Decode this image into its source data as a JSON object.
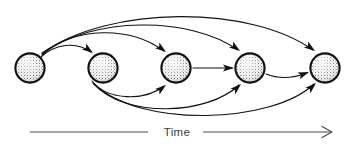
{
  "figure": {
    "type": "diagram",
    "title": "",
    "background_color": "#ffffff",
    "ink_color": "#111111",
    "axis_color": "#4a4a4a",
    "width": 355,
    "height": 147
  },
  "axis": {
    "label": "Time",
    "label_x": 177,
    "label_y": 136,
    "left_segment": {
      "x1": 30,
      "y1": 132,
      "x2": 148,
      "y2": 132
    },
    "right_segment": {
      "x1": 203,
      "y1": 132,
      "x2": 331,
      "y2": 132
    },
    "arrowhead": {
      "x": 331,
      "y": 132,
      "style": "open-v"
    },
    "direction": "left-to-right"
  },
  "nodes": [
    {
      "id": "node-1",
      "label": "",
      "cx": 30,
      "cy": 68,
      "r": 15.2,
      "texture": "stipple"
    },
    {
      "id": "node-2",
      "label": "",
      "cx": 103,
      "cy": 68,
      "r": 15.2,
      "texture": "stipple"
    },
    {
      "id": "node-3",
      "label": "",
      "cx": 176,
      "cy": 68,
      "r": 15.2,
      "texture": "stipple"
    },
    {
      "id": "node-4",
      "label": "",
      "cx": 250,
      "cy": 68,
      "r": 15.2,
      "texture": "stipple"
    },
    {
      "id": "node-5",
      "label": "",
      "cx": 325,
      "cy": 68,
      "r": 15.2,
      "texture": "stipple"
    }
  ],
  "edges": [
    {
      "id": "edge-1-2",
      "from": "node-1",
      "to": "node-2",
      "route": "arc-above",
      "d": "M 41 57 C 55 44, 76 41, 91 52"
    },
    {
      "id": "edge-1-3",
      "from": "node-1",
      "to": "node-3",
      "route": "arc-above",
      "d": "M 42 55 C 75 26, 130 26, 164 51"
    },
    {
      "id": "edge-1-4",
      "from": "node-1",
      "to": "node-4",
      "route": "arc-above",
      "d": "M 42 54 C 92 16, 190 16, 238 50"
    },
    {
      "id": "edge-1-5",
      "from": "node-1",
      "to": "node-5",
      "route": "arc-above",
      "d": "M 42 53 C 110 5, 250 5, 313 50"
    },
    {
      "id": "edge-2-3",
      "from": "node-2",
      "to": "node-3",
      "route": "arc-below",
      "d": "M 92 81 C 108 101, 145 101, 164 86"
    },
    {
      "id": "edge-2-4",
      "from": "node-2",
      "to": "node-4",
      "route": "arc-below",
      "d": "M 93 83 C 125 119, 208 115, 239 85"
    },
    {
      "id": "edge-2-5",
      "from": "node-2",
      "to": "node-5",
      "route": "arc-below",
      "d": "M 94 84 C 140 128, 272 124, 314 84"
    },
    {
      "id": "edge-3-4",
      "from": "node-3",
      "to": "node-4",
      "route": "straight",
      "d": "M 193 68 L 232 68"
    },
    {
      "id": "edge-4-5",
      "from": "node-4",
      "to": "node-5",
      "route": "arc-slight",
      "d": "M 266 74 C 281 80, 294 78, 307 73"
    }
  ],
  "arrowheads": [
    {
      "edge": "edge-1-2",
      "x": 93,
      "y": 53,
      "angle": 36
    },
    {
      "edge": "edge-1-3",
      "x": 166,
      "y": 52,
      "angle": 37
    },
    {
      "edge": "edge-1-4",
      "x": 240,
      "y": 51,
      "angle": 36
    },
    {
      "edge": "edge-1-5",
      "x": 315,
      "y": 51,
      "angle": 36
    },
    {
      "edge": "edge-2-3",
      "x": 166,
      "y": 85,
      "angle": -38
    },
    {
      "edge": "edge-2-4",
      "x": 241,
      "y": 84,
      "angle": -43
    },
    {
      "edge": "edge-2-5",
      "x": 316,
      "y": 83,
      "angle": -43
    },
    {
      "edge": "edge-3-4",
      "x": 234,
      "y": 68,
      "angle": 0
    },
    {
      "edge": "edge-4-5",
      "x": 309,
      "y": 72,
      "angle": -20
    }
  ],
  "counts": {
    "node_count": 5,
    "edge_count": 9
  }
}
